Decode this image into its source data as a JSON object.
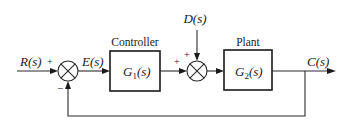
{
  "diagram": {
    "type": "feedback-control-block-diagram",
    "signals": {
      "input": "R(s)",
      "error": "E(s)",
      "disturbance": "D(s)",
      "output": "C(s)"
    },
    "blocks": [
      {
        "id": "controller",
        "title": "Controller",
        "transfer_function": "G1(s)",
        "tf_main": "G",
        "tf_sub": "1",
        "tf_arg": "(s)"
      },
      {
        "id": "plant",
        "title": "Plant",
        "transfer_function": "G2(s)",
        "tf_main": "G",
        "tf_sub": "2",
        "tf_arg": "(s)"
      }
    ],
    "summing_junctions": [
      {
        "id": "sum1",
        "signs": {
          "input": "+",
          "feedback": "−"
        }
      },
      {
        "id": "sum2",
        "signs": {
          "controller": "+",
          "disturbance": "+"
        }
      }
    ],
    "feedback": "unity negative feedback from C(s) to first summing junction",
    "colors": {
      "line": "#2a2a2a",
      "background": "#ffffff"
    }
  }
}
